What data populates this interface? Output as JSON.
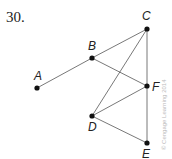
{
  "problem_number": "30.",
  "credit": "© Cengage Learning 2014",
  "points": [
    {
      "id": "A",
      "x": 37,
      "y": 88
    },
    {
      "id": "B",
      "x": 92,
      "y": 58
    },
    {
      "id": "C",
      "x": 147,
      "y": 29
    },
    {
      "id": "D",
      "x": 92,
      "y": 116
    },
    {
      "id": "E",
      "x": 147,
      "y": 143
    },
    {
      "id": "F",
      "x": 147,
      "y": 86
    }
  ],
  "segments": [
    [
      "A",
      "B"
    ],
    [
      "B",
      "C"
    ],
    [
      "B",
      "F"
    ],
    [
      "C",
      "D"
    ],
    [
      "C",
      "E"
    ],
    [
      "D",
      "F"
    ],
    [
      "D",
      "E"
    ]
  ],
  "labels": {
    "A": "A",
    "B": "B",
    "C": "C",
    "D": "D",
    "E": "E",
    "F": "F"
  }
}
